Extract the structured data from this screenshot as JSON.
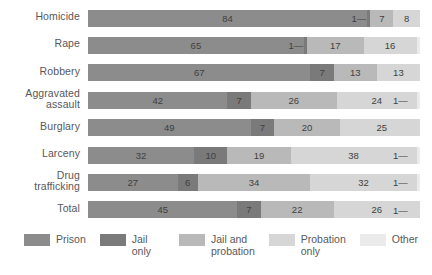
{
  "chart_data": {
    "type": "bar",
    "subtype": "horizontal-stacked-percent",
    "title": "",
    "xlabel": "",
    "ylabel": "",
    "xlim": [
      0,
      100
    ],
    "grid": false,
    "legend_position": "bottom",
    "categories": [
      "Homicide",
      "Rape",
      "Robbery",
      "Aggravated assault",
      "Burglary",
      "Larceny",
      "Drug trafficking",
      "Total"
    ],
    "series": [
      {
        "name": "Prison",
        "color": "#8c8c8c",
        "values": [
          84,
          65,
          67,
          42,
          49,
          32,
          27,
          45
        ]
      },
      {
        "name": "Jail only",
        "color": "#7a7a7a",
        "values": [
          1,
          1,
          7,
          7,
          7,
          10,
          6,
          7
        ]
      },
      {
        "name": "Jail and probation",
        "color": "#b9b9b9",
        "values": [
          7,
          17,
          13,
          26,
          20,
          19,
          34,
          22
        ]
      },
      {
        "name": "Probation only",
        "color": "#d6d6d6",
        "values": [
          8,
          16,
          13,
          24,
          25,
          38,
          32,
          26
        ]
      },
      {
        "name": "Other",
        "color": "#ebebeb",
        "values": [
          0,
          0,
          0,
          1,
          0,
          1,
          1,
          1
        ]
      }
    ]
  },
  "rows": [
    {
      "label": "Homicide",
      "lines": [
        "Homicide"
      ],
      "segments": [
        {
          "series": "Prison",
          "value": 84,
          "label": "84",
          "tiny": false
        },
        {
          "series": "Jail only",
          "value": 1,
          "label": "1",
          "tiny": true
        },
        {
          "series": "Jail and probation",
          "value": 7,
          "label": "7",
          "tiny": false
        },
        {
          "series": "Probation only",
          "value": 8,
          "label": "8",
          "tiny": false
        }
      ]
    },
    {
      "label": "Rape",
      "lines": [
        "Rape"
      ],
      "segments": [
        {
          "series": "Prison",
          "value": 65,
          "label": "65",
          "tiny": false
        },
        {
          "series": "Jail only",
          "value": 1,
          "label": "1",
          "tiny": true
        },
        {
          "series": "Jail and probation",
          "value": 17,
          "label": "17",
          "tiny": false
        },
        {
          "series": "Probation only",
          "value": 16,
          "label": "16",
          "tiny": false
        }
      ]
    },
    {
      "label": "Robbery",
      "lines": [
        "Robbery"
      ],
      "segments": [
        {
          "series": "Prison",
          "value": 67,
          "label": "67",
          "tiny": false
        },
        {
          "series": "Jail only",
          "value": 7,
          "label": "7",
          "tiny": false
        },
        {
          "series": "Jail and probation",
          "value": 13,
          "label": "13",
          "tiny": false
        },
        {
          "series": "Probation only",
          "value": 13,
          "label": "13",
          "tiny": false
        }
      ]
    },
    {
      "label": "Aggravated assault",
      "lines": [
        "Aggravated",
        "assault"
      ],
      "segments": [
        {
          "series": "Prison",
          "value": 42,
          "label": "42",
          "tiny": false
        },
        {
          "series": "Jail only",
          "value": 7,
          "label": "7",
          "tiny": false
        },
        {
          "series": "Jail and probation",
          "value": 26,
          "label": "26",
          "tiny": false
        },
        {
          "series": "Probation only",
          "value": 24,
          "label": "24",
          "tiny": false
        },
        {
          "series": "Other",
          "value": 1,
          "label": "1",
          "tiny": true
        }
      ]
    },
    {
      "label": "Burglary",
      "lines": [
        "Burglary"
      ],
      "segments": [
        {
          "series": "Prison",
          "value": 49,
          "label": "49",
          "tiny": false
        },
        {
          "series": "Jail only",
          "value": 7,
          "label": "7",
          "tiny": false
        },
        {
          "series": "Jail and probation",
          "value": 20,
          "label": "20",
          "tiny": false
        },
        {
          "series": "Probation only",
          "value": 25,
          "label": "25",
          "tiny": false
        }
      ]
    },
    {
      "label": "Larceny",
      "lines": [
        "Larceny"
      ],
      "segments": [
        {
          "series": "Prison",
          "value": 32,
          "label": "32",
          "tiny": false
        },
        {
          "series": "Jail only",
          "value": 10,
          "label": "10",
          "tiny": false
        },
        {
          "series": "Jail and probation",
          "value": 19,
          "label": "19",
          "tiny": false
        },
        {
          "series": "Probation only",
          "value": 38,
          "label": "38",
          "tiny": false
        },
        {
          "series": "Other",
          "value": 1,
          "label": "1",
          "tiny": true
        }
      ]
    },
    {
      "label": "Drug trafficking",
      "lines": [
        "Drug",
        "trafficking"
      ],
      "segments": [
        {
          "series": "Prison",
          "value": 27,
          "label": "27",
          "tiny": false
        },
        {
          "series": "Jail only",
          "value": 6,
          "label": "6",
          "tiny": false
        },
        {
          "series": "Jail and probation",
          "value": 34,
          "label": "34",
          "tiny": false
        },
        {
          "series": "Probation only",
          "value": 32,
          "label": "32",
          "tiny": false
        },
        {
          "series": "Other",
          "value": 1,
          "label": "1",
          "tiny": true
        }
      ]
    },
    {
      "label": "Total",
      "lines": [
        "Total"
      ],
      "segments": [
        {
          "series": "Prison",
          "value": 45,
          "label": "45",
          "tiny": false
        },
        {
          "series": "Jail only",
          "value": 7,
          "label": "7",
          "tiny": false
        },
        {
          "series": "Jail and probation",
          "value": 22,
          "label": "22",
          "tiny": false
        },
        {
          "series": "Probation only",
          "value": 26,
          "label": "26",
          "tiny": false
        },
        {
          "series": "Other",
          "value": 1,
          "label": "1",
          "tiny": true
        }
      ]
    }
  ],
  "legend": {
    "items": [
      {
        "label": "Prison",
        "color": "#8c8c8c"
      },
      {
        "label": "Jail only",
        "color": "#7a7a7a"
      },
      {
        "label": "Jail and\nprobation",
        "color": "#b9b9b9"
      },
      {
        "label": "Probation\nonly",
        "color": "#d6d6d6"
      },
      {
        "label": "Other",
        "color": "#ebebeb"
      }
    ]
  },
  "style": {
    "colors": {
      "prison": "#8c8c8c",
      "jail_only": "#7a7a7a",
      "jail_and_probation": "#b9b9b9",
      "probation_only": "#d6d6d6",
      "other": "#ebebeb",
      "text": "#58585a",
      "value_text": "#3f3f3f",
      "background": "#ffffff"
    },
    "tiny_marker": "—"
  }
}
